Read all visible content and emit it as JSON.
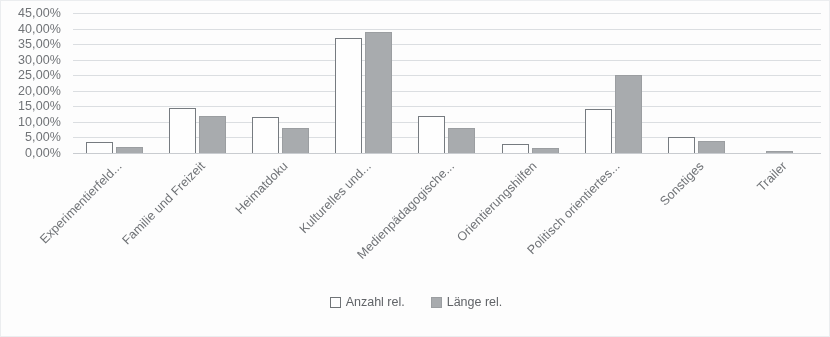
{
  "chart_data": {
    "type": "bar",
    "title": "",
    "subtitle": "",
    "xlabel": "",
    "ylabel": "",
    "ylim": [
      0,
      45
    ],
    "ytick_labels": [
      "45,00%",
      "40,00%",
      "35,00%",
      "30,00%",
      "25,00%",
      "20,00%",
      "15,00%",
      "10,00%",
      "5,00%",
      "0,00%"
    ],
    "ytick_values": [
      45,
      40,
      35,
      30,
      25,
      20,
      15,
      10,
      5,
      0
    ],
    "grid": true,
    "legend_position": "bottom",
    "categories": [
      "Experimentierfeld...",
      "Familie und Freizeit",
      "Heimatdoku",
      "Kulturelles und...",
      "Medienpädagogische...",
      "Orientierungshilfen",
      "Politisch orientiertes...",
      "Sonstiges",
      "Trailer"
    ],
    "series": [
      {
        "name": "Anzahl rel.",
        "color": "#ffffff",
        "values": [
          3.5,
          14.5,
          11.5,
          37.0,
          12.0,
          3.0,
          14.3,
          5.0,
          0.0
        ]
      },
      {
        "name": "Länge rel.",
        "color": "#a8abae",
        "values": [
          2.0,
          12.0,
          8.0,
          39.0,
          8.0,
          1.5,
          25.0,
          4.0,
          0.7
        ]
      }
    ]
  },
  "legend": {
    "items": [
      {
        "label": "Anzahl rel.",
        "swatch": "outlined-square"
      },
      {
        "label": "Länge rel.",
        "swatch": "filled-square"
      }
    ]
  },
  "colors": {
    "gridline": "#dcdfe2",
    "bar_outline": "#757a7f",
    "bar_fill_gray": "#a8abae",
    "text": "#6d7074",
    "background": "#fefefe"
  }
}
